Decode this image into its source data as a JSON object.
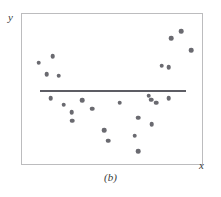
{
  "figure": {
    "caption": "(b)",
    "y_axis_label": "y",
    "x_axis_label": "x",
    "point_color": "#6a6a70",
    "line_color": "#5d5d64",
    "frame_color": "#bcbcbe",
    "background_color": "#ffffff"
  },
  "chart_data": {
    "type": "scatter",
    "title": "(b)",
    "xlabel": "x",
    "ylabel": "y",
    "xlim": [
      0,
      100
    ],
    "ylim": [
      0,
      100
    ],
    "grid": false,
    "legend": null,
    "axis_ticks": {
      "x": [],
      "y": []
    },
    "series": [
      {
        "name": "observations",
        "marker": "circle",
        "color": "#6a6a70",
        "x": [
          9.3,
          17.0,
          13.7,
          20.3,
          16.0,
          23.1,
          27.5,
          33.5,
          28.0,
          39.0,
          45.6,
          48.0,
          54.3,
          62.5,
          64.5,
          71.8,
          64.5,
          72.0,
          74.5,
          81.5,
          77.5,
          94.0,
          83.0,
          88.5,
          70.3,
          81.5
        ],
        "y": [
          67.5,
          72.0,
          60.0,
          59.0,
          44.0,
          39.5,
          34.5,
          42.5,
          29.0,
          37.0,
          22.5,
          15.5,
          41.0,
          19.0,
          31.0,
          43.0,
          8.5,
          26.5,
          41.0,
          44.0,
          65.5,
          76.0,
          84.0,
          88.5,
          45.5,
          64.5
        ]
      }
    ],
    "fit_line": {
      "name": "fitted regression line",
      "type": "horizontal",
      "color": "#5d5d64",
      "x_start": 9.9,
      "x_end": 91.2,
      "y": 49.5
    },
    "annotation": "Scatter of points forms a U-shaped curvilinear pattern; the fitted straight line is flat and fits poorly."
  }
}
